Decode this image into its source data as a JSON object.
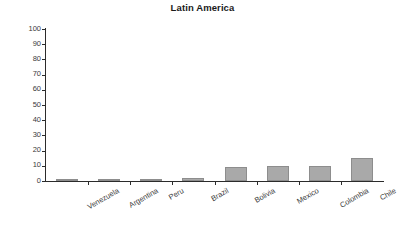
{
  "chart_data": {
    "type": "bar",
    "title": "Latin America",
    "xlabel": "",
    "ylabel": "",
    "ylim": [
      0,
      100
    ],
    "yticks": [
      0,
      10,
      20,
      30,
      40,
      50,
      60,
      70,
      80,
      90,
      100
    ],
    "grid": false,
    "legend": "none",
    "bar_color": "#a9a9a9",
    "bar_edge_color": "#8d8d8d",
    "axis_color": "#2b2b2b",
    "background": "#ffffff",
    "categories": [
      "Venezuela",
      "Argentina",
      "Peru",
      "Brazil",
      "Bolivia",
      "Mexico",
      "Colombia",
      "Chile"
    ],
    "values": [
      0.3,
      1,
      1.5,
      2,
      9.5,
      10,
      10,
      15
    ]
  }
}
